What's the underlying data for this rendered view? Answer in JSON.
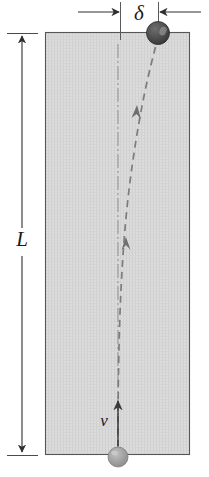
{
  "figure": {
    "type": "physics-diagram",
    "width": 209,
    "height": 477,
    "background_color": "#ffffff"
  },
  "labels": {
    "delta": "δ",
    "length": "L",
    "velocity": "v"
  },
  "colors": {
    "background": "#ffffff",
    "column_fill": "#d8d8d8",
    "column_stroke": "#4a4a4a",
    "line": "#3a3a3a",
    "dark_ball": "#4a4a4a",
    "dark_ball_highlight": "#8e8e8e",
    "light_ball": "#9a9a9a",
    "light_ball_highlight": "#c4c4c4",
    "centerline": "#8a8a8a",
    "trajectory": "#7a7a7a"
  },
  "column": {
    "left": 45,
    "top": 32,
    "right": 190,
    "bottom": 455
  },
  "dimension_delta": {
    "name": "delta",
    "baseline_y": 12,
    "extension_left_x": 120,
    "extension_right_x": 158,
    "label_x": 139,
    "label_y": 20,
    "arrow_left_start_x": 78,
    "arrow_right_start_x": 200
  },
  "dimension_length": {
    "name": "L",
    "axis_x": 22,
    "top_y": 34,
    "bottom_y": 455,
    "label_x": 22,
    "label_y": 245,
    "tick_half_width": 15
  },
  "centerline": {
    "x": 118,
    "top_y": 44,
    "bottom_y": 448
  },
  "trajectory": {
    "start_x": 118,
    "start_y": 447,
    "end_x": 156,
    "end_y": 44,
    "arrowhead_count": 2
  },
  "balls": [
    {
      "name": "dark-ball",
      "position": "top-right-corner",
      "cx": 158,
      "cy": 33,
      "r": 11.5,
      "fill": "#4a4a4a"
    },
    {
      "name": "light-ball",
      "position": "bottom-center",
      "cx": 118,
      "cy": 457,
      "r": 10,
      "fill": "#9a9a9a"
    }
  ],
  "velocity_arrow": {
    "x": 118,
    "tail_y": 446,
    "head_y": 399,
    "label_x": 104,
    "label_y": 424
  }
}
